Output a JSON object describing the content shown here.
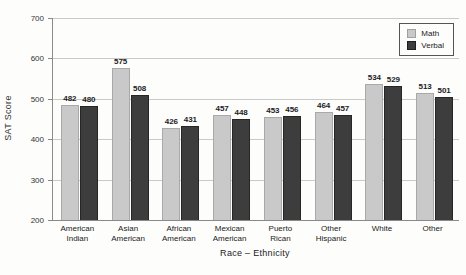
{
  "chart_data": {
    "type": "bar",
    "title": "",
    "xlabel": "Race – Ethnicity",
    "ylabel": "SAT Score",
    "ylim": [
      200,
      700
    ],
    "yticks": [
      200,
      300,
      400,
      500,
      600,
      700
    ],
    "grid": "horizontal",
    "legend_position": "top-right-inside",
    "bar_value_labels_shown": true,
    "categories": [
      "American Indian",
      "Asian American",
      "African American",
      "Mexican American",
      "Puerto Rican",
      "Other Hispanic",
      "White",
      "Other"
    ],
    "series": [
      {
        "name": "Math",
        "color": "#c9c9c9",
        "values": [
          482,
          575,
          426,
          457,
          453,
          464,
          534,
          513
        ]
      },
      {
        "name": "Verbal",
        "color": "#3d3d3d",
        "values": [
          480,
          508,
          431,
          448,
          456,
          457,
          529,
          501
        ]
      }
    ]
  },
  "colors": {
    "background": "#fdfdfc",
    "gridline": "#c9c9c7",
    "axis_line": "#8a8a8a",
    "math_bar": "#c9c9c9",
    "verbal_bar": "#3d3d3d",
    "text": "#222222"
  }
}
